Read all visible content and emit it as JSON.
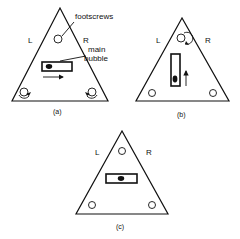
{
  "figure": {
    "panels": [
      {
        "id": "a",
        "caption": "(a)",
        "left_label": "L",
        "right_label": "R",
        "callouts": {
          "footscrews": "footscrews",
          "main_bubble_line1": "main",
          "main_bubble_line2": "bubble"
        },
        "bubble_orientation": "horizontal",
        "movement_arrow": "right",
        "rotating_screws": [
          "bottom-left",
          "bottom-right"
        ]
      },
      {
        "id": "b",
        "caption": "(b)",
        "left_label": "L",
        "right_label": "R",
        "bubble_orientation": "vertical",
        "movement_arrow": "up",
        "rotating_screws": [
          "top"
        ]
      },
      {
        "id": "c",
        "caption": "(c)",
        "left_label": "L",
        "right_label": "R",
        "bubble_orientation": "horizontal",
        "bubble_state": "centered"
      }
    ]
  }
}
